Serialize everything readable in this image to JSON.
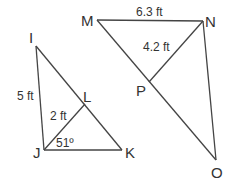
{
  "diagram": {
    "type": "geometry",
    "figures": [
      {
        "name": "triangle-IJK",
        "vertices": {
          "I": "I",
          "J": "J",
          "K": "K",
          "L": "L"
        },
        "measurements": {
          "IJ": "5 ft",
          "JL": "2 ft",
          "angle_J": "51º"
        }
      },
      {
        "name": "figure-MNOP",
        "vertices": {
          "M": "M",
          "N": "N",
          "O": "O",
          "P": "P"
        },
        "measurements": {
          "MN": "6.3 ft",
          "NP": "4.2 ft"
        }
      }
    ],
    "labels": {
      "I": "I",
      "J": "J",
      "K": "K",
      "L": "L",
      "M": "M",
      "N": "N",
      "O": "O",
      "P": "P",
      "ij_length": "5 ft",
      "jl_length": "2 ft",
      "angle_j": "51º",
      "mn_length": "6.3 ft",
      "np_length": "4.2 ft"
    },
    "colors": {
      "line": "#444444",
      "text": "#333333",
      "background": "#ffffff"
    }
  }
}
